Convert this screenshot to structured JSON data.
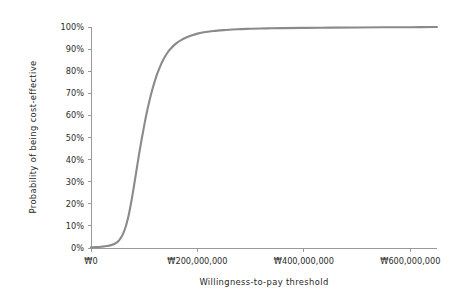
{
  "chart_data": {
    "type": "line",
    "title": "",
    "xlabel": "Willingness-to-pay threshold",
    "ylabel": "Probability of being cost-effective",
    "xlim": [
      0,
      650000000
    ],
    "ylim": [
      0,
      1
    ],
    "grid": false,
    "legend": "none",
    "curve_color": "#8a8a8a",
    "axis_color": "#9a9a9a",
    "text_color": "#2b2b2b",
    "x_ticks": [
      {
        "value": 0,
        "label": "₩0"
      },
      {
        "value": 200000000,
        "label": "₩200,000,000"
      },
      {
        "value": 400000000,
        "label": "₩400,000,000"
      },
      {
        "value": 600000000,
        "label": "₩600,000,000"
      }
    ],
    "y_ticks": [
      {
        "value": 0.0,
        "label": "0%"
      },
      {
        "value": 0.1,
        "label": "10%"
      },
      {
        "value": 0.2,
        "label": "20%"
      },
      {
        "value": 0.3,
        "label": "30%"
      },
      {
        "value": 0.4,
        "label": "40%"
      },
      {
        "value": 0.5,
        "label": "50%"
      },
      {
        "value": 0.6,
        "label": "60%"
      },
      {
        "value": 0.7,
        "label": "70%"
      },
      {
        "value": 0.8,
        "label": "80%"
      },
      {
        "value": 0.9,
        "label": "90%"
      },
      {
        "value": 1.0,
        "label": "100%"
      }
    ],
    "series": [
      {
        "name": "Cost-effectiveness acceptability curve",
        "x": [
          0,
          10000000,
          20000000,
          30000000,
          40000000,
          50000000,
          55000000,
          60000000,
          65000000,
          70000000,
          75000000,
          80000000,
          85000000,
          90000000,
          95000000,
          100000000,
          105000000,
          110000000,
          115000000,
          120000000,
          125000000,
          130000000,
          135000000,
          140000000,
          145000000,
          150000000,
          160000000,
          170000000,
          180000000,
          190000000,
          200000000,
          215000000,
          230000000,
          250000000,
          275000000,
          300000000,
          330000000,
          360000000,
          400000000,
          450000000,
          500000000,
          550000000,
          600000000,
          650000000
        ],
        "y": [
          0.003,
          0.004,
          0.006,
          0.009,
          0.015,
          0.028,
          0.042,
          0.063,
          0.095,
          0.14,
          0.2,
          0.27,
          0.345,
          0.42,
          0.49,
          0.555,
          0.615,
          0.668,
          0.715,
          0.756,
          0.792,
          0.822,
          0.848,
          0.87,
          0.888,
          0.903,
          0.926,
          0.942,
          0.954,
          0.963,
          0.97,
          0.977,
          0.982,
          0.986,
          0.99,
          0.992,
          0.994,
          0.995,
          0.996,
          0.997,
          0.998,
          0.999,
          0.999,
          1.0
        ]
      }
    ]
  },
  "layout": {
    "plot_left": 91,
    "plot_right": 437,
    "plot_top": 27,
    "plot_bottom": 248
  }
}
